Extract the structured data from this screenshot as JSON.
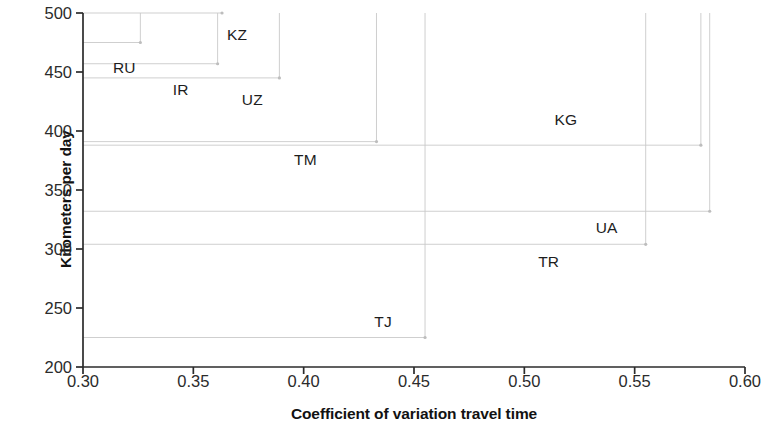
{
  "chart_data": {
    "type": "scatter",
    "title": "",
    "xlabel": "Coefficient of variation travel time",
    "ylabel": "Kilometers per day",
    "xlim": [
      0.3,
      0.6
    ],
    "ylim": [
      200,
      500
    ],
    "xticks": [
      "0.30",
      "0.35",
      "0.40",
      "0.45",
      "0.50",
      "0.55",
      "0.60"
    ],
    "xtick_values": [
      0.3,
      0.35,
      0.4,
      0.45,
      0.5,
      0.55,
      0.6
    ],
    "yticks": [
      "200",
      "250",
      "300",
      "350",
      "400",
      "450",
      "500"
    ],
    "ytick_values": [
      200,
      250,
      300,
      350,
      400,
      450,
      500
    ],
    "grid": false,
    "guide_lines": true,
    "legend": "none",
    "marker_style": "crosshair-intersection",
    "points": [
      {
        "label": "RU",
        "x": 0.326,
        "y": 475,
        "label_dx": -16,
        "label_dy": 25
      },
      {
        "label": "KZ",
        "x": 0.363,
        "y": 500,
        "label_dx": 15,
        "label_dy": 22
      },
      {
        "label": "IR",
        "x": 0.361,
        "y": 457,
        "label_dx": -37,
        "label_dy": 26
      },
      {
        "label": "UZ",
        "x": 0.389,
        "y": 445,
        "label_dx": -27,
        "label_dy": 22
      },
      {
        "label": "TM",
        "x": 0.433,
        "y": 391,
        "label_dx": -71,
        "label_dy": 18
      },
      {
        "label": "KG",
        "x": 0.58,
        "y": 388,
        "label_dx": -135,
        "label_dy": -25
      },
      {
        "label": "UA",
        "x": 0.584,
        "y": 332,
        "label_dx": -103,
        "label_dy": 17
      },
      {
        "label": "TR",
        "x": 0.555,
        "y": 304,
        "label_dx": -97,
        "label_dy": 18
      },
      {
        "label": "TJ",
        "x": 0.455,
        "y": 225,
        "label_dx": -42,
        "label_dy": -16
      }
    ]
  },
  "style": {
    "axis_color": "#2b2b2b",
    "guide_color": "#c9c9c9",
    "text_color": "#1a1a1a",
    "background": "#ffffff"
  }
}
